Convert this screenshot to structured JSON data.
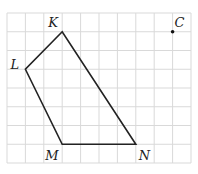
{
  "figure": {
    "type": "grid-polygon",
    "grid": {
      "cols": 10,
      "rows": 8,
      "origin_px": [
        7,
        13
      ],
      "cell_w": 18.4,
      "cell_h": 18.75,
      "line_color": "#d9d9d9"
    },
    "polygon": {
      "name": "KLMN",
      "stroke": "#222222",
      "vertices": [
        {
          "label": "K",
          "col": 3,
          "row": 1
        },
        {
          "label": "L",
          "col": 1,
          "row": 3
        },
        {
          "label": "M",
          "col": 3,
          "row": 7
        },
        {
          "label": "N",
          "col": 7,
          "row": 7
        }
      ]
    },
    "point": {
      "label": "C",
      "col": 9,
      "row": 1
    }
  },
  "labels": {
    "K": "K",
    "L": "L",
    "M": "M",
    "N": "N",
    "C": "C"
  }
}
